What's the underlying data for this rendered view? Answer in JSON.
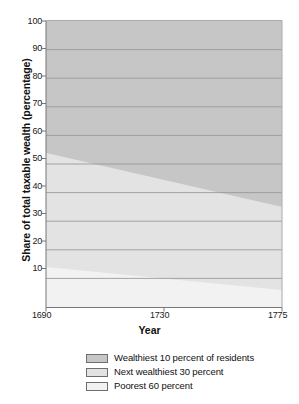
{
  "chart_data": {
    "type": "area",
    "stacked": true,
    "title": "",
    "xlabel": "Year",
    "ylabel": "Share of total taxable wealth (percentage)",
    "x": [
      1690,
      1775
    ],
    "xlim": [
      1690,
      1775
    ],
    "ylim": [
      0,
      100
    ],
    "xticks": [
      "1690",
      "1730",
      "1775"
    ],
    "xtick_values": [
      1690,
      1730,
      1775
    ],
    "yticks": [
      "10",
      "20",
      "30",
      "40",
      "50",
      "60",
      "70",
      "80",
      "90",
      "100"
    ],
    "ytick_values": [
      10,
      20,
      30,
      40,
      50,
      60,
      70,
      80,
      90,
      100
    ],
    "grid": "horizontal",
    "legend_position": "bottom",
    "series": [
      {
        "name": "Wealthiest 10 percent of residents",
        "values": [
          46,
          65
        ],
        "color": "#c4c4c4",
        "stack_top": [
          100,
          100
        ],
        "stack_bottom": [
          54,
          35
        ]
      },
      {
        "name": "Next wealthiest 30 percent",
        "values": [
          40,
          29
        ],
        "color": "#e2e2e2",
        "stack_top": [
          54,
          35
        ],
        "stack_bottom": [
          14,
          6
        ]
      },
      {
        "name": "Poorest 60 percent",
        "values": [
          14,
          6
        ],
        "color": "#f2f2f2",
        "stack_top": [
          14,
          6
        ],
        "stack_bottom": [
          0,
          0
        ]
      }
    ]
  },
  "axes": {
    "y_label": "Share of total taxable wealth (percentage)",
    "x_label": "Year",
    "y_ticks": [
      "100",
      "90",
      "80",
      "70",
      "60",
      "50",
      "40",
      "30",
      "20",
      "10"
    ],
    "x_ticks": [
      "1690",
      "1730",
      "1775"
    ]
  },
  "legend": {
    "items": [
      {
        "label": "Wealthiest 10 percent of residents",
        "color": "#c4c4c4"
      },
      {
        "label": "Next wealthiest 30 percent",
        "color": "#e2e2e2"
      },
      {
        "label": "Poorest 60 percent",
        "color": "#f2f2f2"
      }
    ]
  },
  "colors": {
    "plot_background": "#efefef",
    "gridline": "#9a9a9a",
    "axis_line": "#8a8a8a",
    "text": "#1a1a1a",
    "page_background": "#ffffff"
  }
}
